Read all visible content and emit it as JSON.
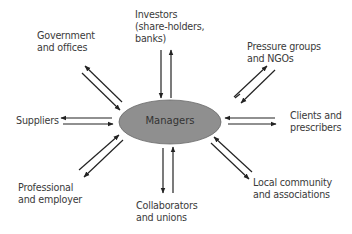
{
  "center": {
    "label": "Managers",
    "fill": "#8f8f8f",
    "stroke": "#6a6a6a"
  },
  "stakeholders": [
    {
      "id": "government",
      "line1": "Government",
      "line2": "and offices",
      "line3": ""
    },
    {
      "id": "investors",
      "line1": "Investors",
      "line2": "(share-holders,",
      "line3": "banks)"
    },
    {
      "id": "pressure",
      "line1": "Pressure groups",
      "line2": "and NGOs",
      "line3": ""
    },
    {
      "id": "suppliers",
      "line1": "Suppliers",
      "line2": "",
      "line3": ""
    },
    {
      "id": "clients",
      "line1": "Clients and",
      "line2": "prescribers",
      "line3": ""
    },
    {
      "id": "professional",
      "line1": "Professional",
      "line2": "and employer",
      "line3": ""
    },
    {
      "id": "collaborators",
      "line1": "Collaborators",
      "line2": "and unions",
      "line3": ""
    },
    {
      "id": "local",
      "line1": "Local community",
      "line2": "and associations",
      "line3": ""
    }
  ],
  "arrow_color": "#222222"
}
